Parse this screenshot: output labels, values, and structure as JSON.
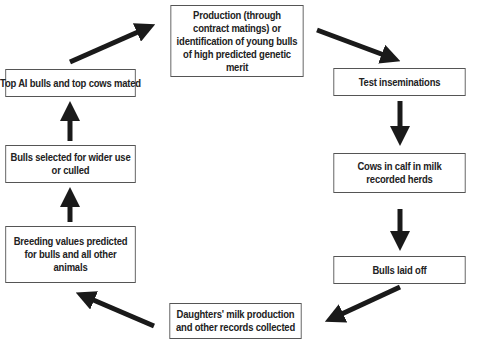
{
  "diagram": {
    "type": "cycle-flowchart",
    "nodes": [
      {
        "id": "production",
        "label": "Production (through contract matings) or identification of young bulls of high predicted genetic merit"
      },
      {
        "id": "test",
        "label": "Test inseminations"
      },
      {
        "id": "cows",
        "label": "Cows in calf in milk recorded herds"
      },
      {
        "id": "laidoff",
        "label": "Bulls laid off"
      },
      {
        "id": "daughters",
        "label": "Daughters' milk production and other records collected"
      },
      {
        "id": "breeding",
        "label": "Breeding values predicted for bulls and all other animals"
      },
      {
        "id": "selected",
        "label": "Bulls selected for wider use or culled"
      },
      {
        "id": "topai",
        "label": "Top AI bulls and top cows mated"
      }
    ],
    "edges": [
      [
        "production",
        "test"
      ],
      [
        "test",
        "cows"
      ],
      [
        "cows",
        "laidoff"
      ],
      [
        "laidoff",
        "daughters"
      ],
      [
        "daughters",
        "breeding"
      ],
      [
        "breeding",
        "selected"
      ],
      [
        "selected",
        "topai"
      ],
      [
        "topai",
        "production"
      ]
    ],
    "colors": {
      "arrow": "#1a1a1a",
      "border": "#555555",
      "text": "#222222"
    }
  }
}
